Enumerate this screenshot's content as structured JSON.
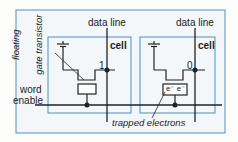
{
  "diagram": {
    "labels": {
      "data_line_1": "data line",
      "data_line_2": "data line",
      "cell_1": "cell",
      "cell_2": "cell",
      "bit_1": "1",
      "bit_2": "0",
      "floating_gate_line1": "floating",
      "floating_gate_line2": "gate transistor",
      "word_enable_line1": "word",
      "word_enable_line2": "enable",
      "trapped_electrons": "trapped electrons",
      "electrons": "e⁻ e⁻"
    },
    "colors": {
      "box_border": "#4a90c8",
      "box_fill": "#f3f7fb",
      "wire": "#222222"
    }
  }
}
